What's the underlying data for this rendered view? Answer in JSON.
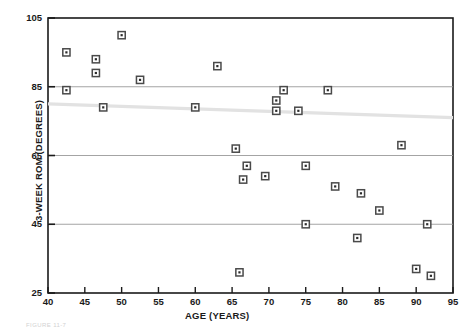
{
  "figure": {
    "caption": "FIGURE 11-7"
  },
  "chart_data": {
    "type": "scatter",
    "title": "",
    "xlabel": "AGE (YEARS)",
    "ylabel": "3-WEEK ROM (DEGREES)",
    "xlim": [
      40,
      95
    ],
    "ylim": [
      25,
      105
    ],
    "xticks": [
      40,
      45,
      50,
      55,
      60,
      65,
      70,
      75,
      80,
      85,
      90,
      95
    ],
    "yticks": [
      25,
      45,
      65,
      85,
      105
    ],
    "grid": "horizontal-gridlines-at-45-65-85",
    "legend": "none",
    "marker": "open-square-with-center-dot",
    "marker_color": "#4a4a4a",
    "frame_color": "#1a1a1a",
    "gridline_color": "#9a9a9a",
    "trendline": {
      "visible": true,
      "color": "#e2e2e2",
      "x_start": 40,
      "y_start": 80,
      "x_end": 95,
      "y_end": 76,
      "description": "faint light-gray nearly flat regression line sloping slightly downward"
    },
    "points": [
      {
        "x": 42.5,
        "y": 95
      },
      {
        "x": 42.5,
        "y": 84
      },
      {
        "x": 46.5,
        "y": 93
      },
      {
        "x": 46.5,
        "y": 89
      },
      {
        "x": 47.5,
        "y": 79
      },
      {
        "x": 50,
        "y": 100
      },
      {
        "x": 52.5,
        "y": 87
      },
      {
        "x": 60,
        "y": 79
      },
      {
        "x": 63,
        "y": 91
      },
      {
        "x": 65.5,
        "y": 67
      },
      {
        "x": 66,
        "y": 31
      },
      {
        "x": 66.5,
        "y": 58
      },
      {
        "x": 67,
        "y": 62
      },
      {
        "x": 69.5,
        "y": 59
      },
      {
        "x": 71,
        "y": 81
      },
      {
        "x": 71,
        "y": 78
      },
      {
        "x": 72,
        "y": 84
      },
      {
        "x": 74,
        "y": 78
      },
      {
        "x": 75,
        "y": 62
      },
      {
        "x": 75,
        "y": 45
      },
      {
        "x": 78,
        "y": 84
      },
      {
        "x": 79,
        "y": 56
      },
      {
        "x": 82,
        "y": 41
      },
      {
        "x": 82.5,
        "y": 54
      },
      {
        "x": 85,
        "y": 49
      },
      {
        "x": 88,
        "y": 68
      },
      {
        "x": 90,
        "y": 32
      },
      {
        "x": 91.5,
        "y": 45
      },
      {
        "x": 92,
        "y": 30
      }
    ]
  }
}
